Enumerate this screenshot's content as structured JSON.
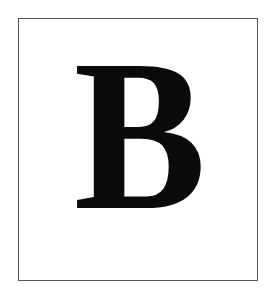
{
  "card": {
    "letter": "B",
    "border_color": "#555555",
    "letter_color": "#0a0a0a",
    "background": "#ffffff"
  }
}
